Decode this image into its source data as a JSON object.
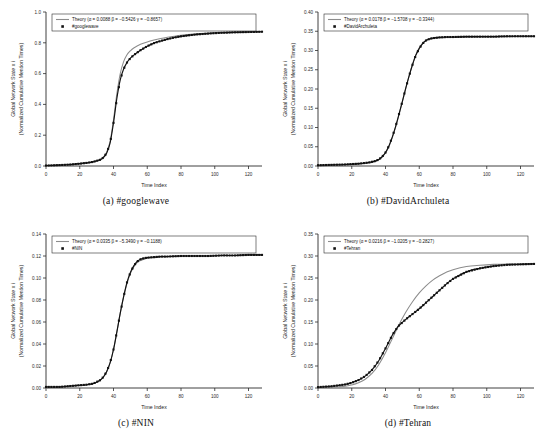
{
  "figure": {
    "axis": {
      "xlabel": "Time Index",
      "ylabel_line1": "Global Network State x",
      "ylabel_sub": "i",
      "ylabel_line2": "(Normalized Cumulative Mention Times)",
      "xticks": [
        0,
        20,
        40,
        60,
        80,
        100,
        120
      ],
      "xlim": [
        0,
        128
      ]
    },
    "legend": {
      "theory_prefix": "Theory (",
      "alpha_sym": "α",
      "beta_sym": "β",
      "gamma_sym": "γ",
      "eq": " = ",
      "close": ")"
    }
  },
  "chart_data": [
    {
      "id": "googlewave",
      "type": "line",
      "panel_label": "(a)",
      "caption": "(a)  #googlewave",
      "series_label": "#googlewave",
      "title": "",
      "xlabel": "Time Index",
      "ylabel": "Global Network State x_i (Normalized Cumulative Mention Times)",
      "xlim": [
        0,
        128
      ],
      "ylim": [
        0.0,
        1.0
      ],
      "yticks": [
        0.0,
        0.2,
        0.4,
        0.6,
        0.8,
        1.0
      ],
      "yticklabels": [
        "0.0",
        "0.2",
        "0.4",
        "0.6",
        "0.8",
        "1.0"
      ],
      "params": {
        "alpha": 0.0088,
        "beta": -0.5426,
        "gamma": -0.8657
      },
      "legend_theory_text": "Theory (α = 0.0088 β = −0.5426 γ = −0.8657)",
      "x": [
        0,
        4,
        8,
        12,
        16,
        20,
        24,
        28,
        32,
        34,
        36,
        38,
        40,
        42,
        44,
        46,
        48,
        50,
        52,
        56,
        60,
        64,
        68,
        72,
        76,
        80,
        88,
        96,
        104,
        112,
        120,
        128
      ],
      "data_values": [
        0.003,
        0.004,
        0.006,
        0.008,
        0.011,
        0.015,
        0.02,
        0.027,
        0.04,
        0.055,
        0.085,
        0.15,
        0.28,
        0.44,
        0.56,
        0.63,
        0.672,
        0.7,
        0.72,
        0.752,
        0.778,
        0.798,
        0.812,
        0.824,
        0.834,
        0.842,
        0.853,
        0.86,
        0.865,
        0.868,
        0.87,
        0.872
      ],
      "theory_values": [
        0.002,
        0.003,
        0.005,
        0.007,
        0.01,
        0.014,
        0.019,
        0.027,
        0.042,
        0.058,
        0.092,
        0.162,
        0.3,
        0.47,
        0.6,
        0.678,
        0.722,
        0.748,
        0.766,
        0.79,
        0.806,
        0.818,
        0.828,
        0.836,
        0.843,
        0.849,
        0.857,
        0.862,
        0.866,
        0.869,
        0.871,
        0.872
      ]
    },
    {
      "id": "DavidArchuleta",
      "type": "line",
      "panel_label": "(b)",
      "caption": "(b)  #DavidArchuleta",
      "series_label": "#DavidArchuleta",
      "title": "",
      "xlabel": "Time Index",
      "ylabel": "Global Network State x_i (Normalized Cumulative Mention Times)",
      "xlim": [
        0,
        128
      ],
      "ylim": [
        0.0,
        0.4
      ],
      "yticks": [
        0.0,
        0.05,
        0.1,
        0.15,
        0.2,
        0.25,
        0.3,
        0.35,
        0.4
      ],
      "yticklabels": [
        "0.00",
        "0.05",
        "0.10",
        "0.15",
        "0.20",
        "0.25",
        "0.30",
        "0.35",
        "0.40"
      ],
      "params": {
        "alpha": 0.0178,
        "beta": -1.5708,
        "gamma": -0.3344
      },
      "legend_theory_text": "Theory (α = 0.0178 β = −1.5708 γ = −0.3344)",
      "x": [
        0,
        8,
        16,
        24,
        30,
        34,
        36,
        38,
        40,
        42,
        44,
        46,
        48,
        50,
        52,
        54,
        56,
        58,
        60,
        62,
        64,
        66,
        68,
        72,
        76,
        80,
        88,
        96,
        104,
        112,
        120,
        128
      ],
      "data_values": [
        0.002,
        0.003,
        0.004,
        0.006,
        0.009,
        0.013,
        0.017,
        0.024,
        0.035,
        0.052,
        0.075,
        0.103,
        0.135,
        0.168,
        0.202,
        0.234,
        0.263,
        0.288,
        0.305,
        0.318,
        0.326,
        0.33,
        0.332,
        0.334,
        0.335,
        0.335,
        0.336,
        0.336,
        0.336,
        0.337,
        0.337,
        0.337
      ],
      "theory_values": [
        0.001,
        0.002,
        0.003,
        0.005,
        0.008,
        0.012,
        0.016,
        0.023,
        0.034,
        0.05,
        0.073,
        0.101,
        0.133,
        0.167,
        0.201,
        0.234,
        0.264,
        0.289,
        0.307,
        0.319,
        0.326,
        0.329,
        0.331,
        0.333,
        0.334,
        0.334,
        0.335,
        0.336,
        0.336,
        0.336,
        0.337,
        0.337
      ]
    },
    {
      "id": "NIN",
      "type": "line",
      "panel_label": "(c)",
      "caption": "(c)  #NIN",
      "series_label": "#NIN",
      "title": "",
      "xlabel": "Time Index",
      "ylabel": "Global Network State x_i (Normalized Cumulative Mention Times)",
      "xlim": [
        0,
        128
      ],
      "ylim": [
        0.0,
        0.14
      ],
      "yticks": [
        0.0,
        0.02,
        0.04,
        0.06,
        0.08,
        0.1,
        0.12,
        0.14
      ],
      "yticklabels": [
        "0.00",
        "0.02",
        "0.04",
        "0.06",
        "0.08",
        "0.10",
        "0.12",
        "0.14"
      ],
      "params": {
        "alpha": 0.0335,
        "beta": -5.349,
        "gamma": -0.1188
      },
      "legend_theory_text": "Theory (α = 0.0335 β = −5.3490 γ = −0.1188)",
      "x": [
        0,
        8,
        16,
        24,
        28,
        32,
        34,
        36,
        38,
        40,
        42,
        44,
        46,
        48,
        50,
        52,
        54,
        56,
        58,
        60,
        64,
        68,
        72,
        80,
        88,
        96,
        104,
        112,
        120,
        128
      ],
      "data_values": [
        0.001,
        0.001,
        0.002,
        0.003,
        0.004,
        0.007,
        0.01,
        0.015,
        0.023,
        0.035,
        0.051,
        0.068,
        0.083,
        0.096,
        0.105,
        0.111,
        0.115,
        0.117,
        0.118,
        0.1185,
        0.119,
        0.1195,
        0.1195,
        0.12,
        0.12,
        0.12,
        0.1205,
        0.1205,
        0.121,
        0.121
      ],
      "theory_values": [
        0.0,
        0.001,
        0.002,
        0.003,
        0.004,
        0.007,
        0.01,
        0.015,
        0.023,
        0.035,
        0.051,
        0.068,
        0.083,
        0.095,
        0.104,
        0.11,
        0.114,
        0.116,
        0.117,
        0.118,
        0.1185,
        0.119,
        0.1195,
        0.12,
        0.12,
        0.12,
        0.1205,
        0.1205,
        0.121,
        0.121
      ]
    },
    {
      "id": "Tehran",
      "type": "line",
      "panel_label": "(d)",
      "caption": "(d)  #Tehran",
      "series_label": "#Tehran",
      "title": "",
      "xlabel": "Time Index",
      "ylabel": "Global Network State x_i (Normalized Cumulative Mention Times)",
      "xlim": [
        0,
        128
      ],
      "ylim": [
        0.0,
        0.35
      ],
      "yticks": [
        0.0,
        0.05,
        0.1,
        0.15,
        0.2,
        0.25,
        0.3,
        0.35
      ],
      "yticklabels": [
        "0.00",
        "0.05",
        "0.10",
        "0.15",
        "0.20",
        "0.25",
        "0.30",
        "0.35"
      ],
      "params": {
        "alpha": 0.0216,
        "beta": -1.0205,
        "gamma": -0.2827
      },
      "legend_theory_text": "Theory (α = 0.0216 β = −1.0205 γ = −0.2827)",
      "x": [
        0,
        8,
        16,
        20,
        24,
        28,
        32,
        36,
        40,
        44,
        46,
        48,
        52,
        56,
        60,
        64,
        68,
        72,
        76,
        80,
        88,
        96,
        104,
        112,
        120,
        128
      ],
      "data_values": [
        0.002,
        0.004,
        0.008,
        0.012,
        0.018,
        0.027,
        0.041,
        0.062,
        0.09,
        0.12,
        0.132,
        0.142,
        0.156,
        0.168,
        0.18,
        0.194,
        0.208,
        0.222,
        0.236,
        0.248,
        0.264,
        0.272,
        0.277,
        0.28,
        0.281,
        0.282
      ],
      "theory_values": [
        0.001,
        0.002,
        0.004,
        0.007,
        0.012,
        0.02,
        0.033,
        0.053,
        0.08,
        0.112,
        0.128,
        0.144,
        0.172,
        0.196,
        0.216,
        0.232,
        0.245,
        0.255,
        0.263,
        0.269,
        0.276,
        0.279,
        0.281,
        0.282,
        0.282,
        0.282
      ]
    }
  ]
}
